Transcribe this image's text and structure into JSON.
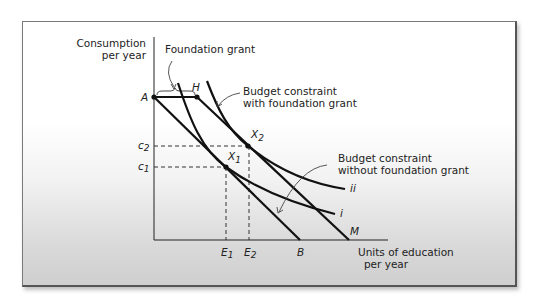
{
  "diagram": {
    "y_axis_label": [
      "Consumption",
      "per year"
    ],
    "x_axis_label": [
      "Units of education",
      "per year"
    ],
    "annotations": {
      "foundation_grant": "Foundation grant",
      "bc_with_grant": [
        "Budget constraint",
        "with foundation grant"
      ],
      "bc_without_grant": [
        "Budget constraint",
        "without foundation grant"
      ]
    },
    "points": {
      "A": "A",
      "H": "H",
      "X1": "X",
      "X1_sub": "1",
      "X2": "X",
      "X2_sub": "2",
      "B": "B",
      "M": "M"
    },
    "y_ticks": {
      "c2": "c",
      "c2_sub": "2",
      "c1": "c",
      "c1_sub": "1"
    },
    "x_ticks": {
      "E1": "E",
      "E1_sub": "1",
      "E2": "E",
      "E2_sub": "2"
    },
    "curves": {
      "i": "i",
      "ii": "ii"
    },
    "colors": {
      "line": "#111111",
      "dashed": "#333333",
      "frame": "#666666"
    }
  }
}
